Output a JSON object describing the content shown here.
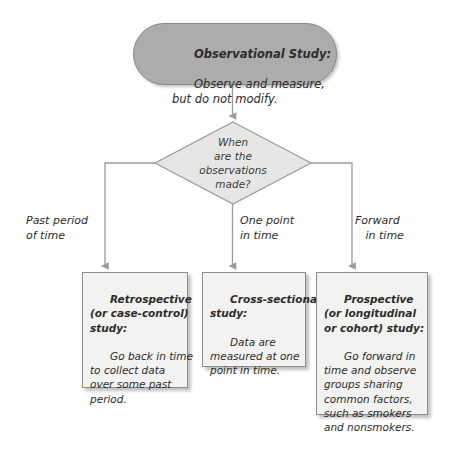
{
  "diagram": {
    "title_node": {
      "heading": "Observational Study:",
      "body": "Observe and measure,\nbut do not modify."
    },
    "decision_node": {
      "text": "When\nare the\nobservations\nmade?"
    },
    "edge_labels": {
      "left": "Past period\nof time",
      "middle": "One point\nin time",
      "right": "Forward\n   in time"
    },
    "outcomes": [
      {
        "name": "retrospective",
        "heading": "Retrospective\n(or case-control)\nstudy:",
        "body": "Go back in time\nto collect data\nover some past\nperiod."
      },
      {
        "name": "cross-sectional",
        "heading": "Cross-sectional\nstudy:",
        "body": "Data are\nmeasured at one\npoint in time."
      },
      {
        "name": "prospective",
        "heading": "Prospective\n(or longitudinal\nor cohort) study:",
        "body": "Go forward in\ntime and observe\ngroups sharing\ncommon factors,\nsuch as smokers\nand nonsmokers."
      }
    ],
    "colors": {
      "pill_fill": "#acacac",
      "pill_stroke": "#8a8a8a",
      "diamond_fill": "#e6e6e4",
      "diamond_stroke": "#9a9a9a",
      "box_fill": "#f2f2f0",
      "box_stroke": "#8d8d8d",
      "connector": "#9b9b9b",
      "text": "#2c2c2c",
      "background": "#ffffff"
    }
  }
}
